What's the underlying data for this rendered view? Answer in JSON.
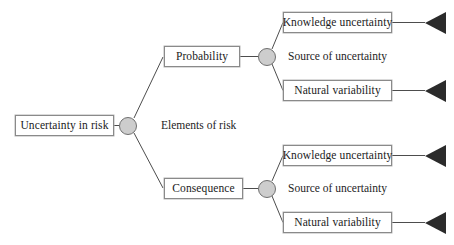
{
  "diagram": {
    "title": "Uncertainty in risk",
    "type": "tree-diagram",
    "background_color": "#ffffff",
    "box_border_color": "#8a8a8a",
    "junction_fill_color": "#cdcdcd",
    "junction_border_color": "#6f6f6f",
    "arrow_color": "#2b2b2b",
    "line_color": "#4d4d4d",
    "root": {
      "label": "Uncertainty in risk"
    },
    "level_labels": {
      "elements": "Elements of risk",
      "sources_top": "Source of uncertainty",
      "sources_bottom": "Source of uncertainty"
    },
    "branches": [
      {
        "label": "Probability",
        "leaves": [
          {
            "label": "Knowledge uncertainty",
            "arrow": true
          },
          {
            "label": "Natural variability",
            "arrow": true
          }
        ]
      },
      {
        "label": "Consequence",
        "leaves": [
          {
            "label": "Knowledge uncertainty",
            "arrow": true
          },
          {
            "label": "Natural variability",
            "arrow": true
          }
        ]
      }
    ]
  }
}
